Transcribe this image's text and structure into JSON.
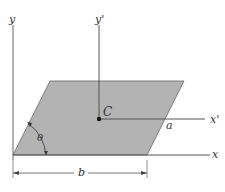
{
  "diagram": {
    "axes": {
      "x": "x",
      "y": "y",
      "x_prime": "x'",
      "y_prime": "y'"
    },
    "centroid": "C",
    "angle": "θ",
    "side_a": "a",
    "base_b": "b",
    "colors": {
      "fill": "#b3b3b3",
      "line": "#555555"
    }
  }
}
